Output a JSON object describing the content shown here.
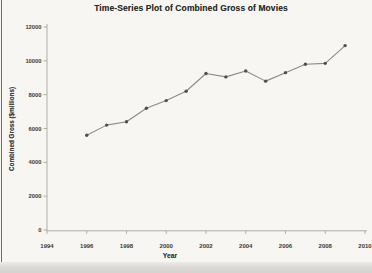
{
  "chart_data": {
    "type": "line",
    "title": "Time-Series Plot of Combined Gross of Movies",
    "xlabel": "Year",
    "ylabel": "Combined Gross ($millions)",
    "x": [
      1996,
      1997,
      1998,
      1999,
      2000,
      2001,
      2002,
      2003,
      2004,
      2005,
      2006,
      2007,
      2008,
      2009
    ],
    "values": [
      5600,
      6200,
      6400,
      7200,
      7650,
      8200,
      9250,
      9050,
      9400,
      8800,
      9300,
      9800,
      9850,
      10900
    ],
    "xlim": [
      1994,
      2010
    ],
    "ylim": [
      0,
      12000
    ],
    "x_ticks": [
      1994,
      1996,
      1998,
      2000,
      2002,
      2004,
      2006,
      2008,
      2010
    ],
    "y_ticks": [
      0,
      2000,
      4000,
      6000,
      8000,
      10000,
      12000
    ],
    "grid": false,
    "legend": "none",
    "marker": "dot",
    "line_color": "#8c8b89",
    "marker_color": "#4f4e4c",
    "axis_color": "#a7a6a3",
    "tick_text_color": "#3b3a37"
  },
  "page": {
    "background_color": "#f7f6f3",
    "appearance": "grayscale scanned textbook figure"
  }
}
